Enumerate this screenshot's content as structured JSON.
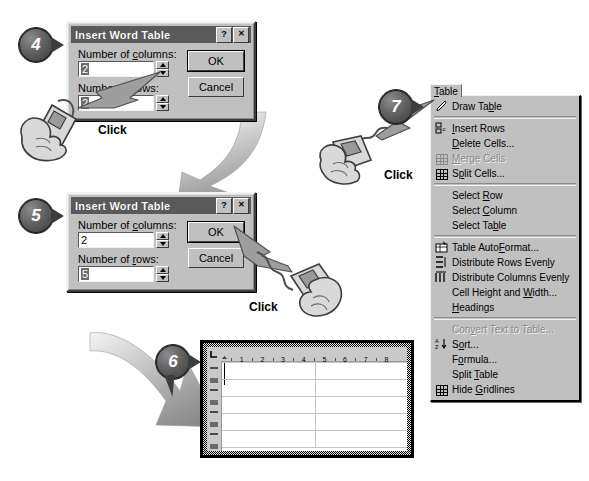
{
  "steps": [
    {
      "n": "4"
    },
    {
      "n": "5"
    },
    {
      "n": "6"
    },
    {
      "n": "7"
    }
  ],
  "dialog4": {
    "title": "Insert Word Table",
    "help_btn": "?",
    "close_btn": "✕",
    "columns_label_a": "Number of ",
    "columns_label_u": "c",
    "columns_label_b": "olumns:",
    "columns_value": "2",
    "rows_label_a": "Number of ",
    "rows_label_u": "r",
    "rows_label_b": "ows:",
    "rows_value": "2",
    "ok": "OK",
    "cancel": "Cancel"
  },
  "dialog5": {
    "title": "Insert Word Table",
    "help_btn": "?",
    "close_btn": "✕",
    "columns_label_a": "Number of ",
    "columns_label_u": "c",
    "columns_label_b": "olumns:",
    "columns_value": "2",
    "rows_label_a": "Number of ",
    "rows_label_u": "r",
    "rows_label_b": "ows:",
    "rows_value": "5",
    "ok": "OK",
    "cancel": "Cancel"
  },
  "clicks": [
    {
      "label": "Click"
    },
    {
      "label": "Click"
    },
    {
      "label": "Click"
    }
  ],
  "menu": {
    "tab_label": "Table",
    "tab_label_u": "T",
    "items": [
      {
        "type": "item",
        "icon": "pencil-icon",
        "pre": "Draw Ta",
        "u": "b",
        "post": "le",
        "disabled": false
      },
      {
        "type": "sep"
      },
      {
        "type": "item",
        "icon": "insert-rows-icon",
        "pre": "",
        "u": "I",
        "post": "nsert Rows",
        "disabled": false
      },
      {
        "type": "item",
        "icon": "none",
        "pre": "",
        "u": "D",
        "post": "elete Cells...",
        "disabled": false
      },
      {
        "type": "item",
        "icon": "merge-cells-icon",
        "pre": "",
        "u": "M",
        "post": "erge Cells",
        "disabled": true
      },
      {
        "type": "item",
        "icon": "split-cells-icon",
        "pre": "S",
        "u": "p",
        "post": "lit Cells...",
        "disabled": false
      },
      {
        "type": "sep"
      },
      {
        "type": "item",
        "icon": "none",
        "pre": "Select ",
        "u": "R",
        "post": "ow",
        "disabled": false
      },
      {
        "type": "item",
        "icon": "none",
        "pre": "Select ",
        "u": "C",
        "post": "olumn",
        "disabled": false
      },
      {
        "type": "item",
        "icon": "none",
        "pre": "Select Ta",
        "u": "b",
        "post": "le",
        "disabled": false
      },
      {
        "type": "sep"
      },
      {
        "type": "item",
        "icon": "autoformat-icon",
        "pre": "Table Auto",
        "u": "F",
        "post": "ormat...",
        "disabled": false
      },
      {
        "type": "item",
        "icon": "distribute-rows-icon",
        "pre": "Distribute Rows Even",
        "u": "l",
        "post": "y",
        "disabled": false
      },
      {
        "type": "item",
        "icon": "distribute-cols-icon",
        "pre": "Distribute Columns Even",
        "u": "l",
        "post": "y",
        "disabled": false
      },
      {
        "type": "item",
        "icon": "none",
        "pre": "Cell Height and ",
        "u": "W",
        "post": "idth...",
        "disabled": false
      },
      {
        "type": "item",
        "icon": "none",
        "pre": "",
        "u": "H",
        "post": "eadings",
        "disabled": false
      },
      {
        "type": "sep"
      },
      {
        "type": "item",
        "icon": "none",
        "pre": "Con",
        "u": "v",
        "post": "ert Text to Table...",
        "disabled": true
      },
      {
        "type": "item",
        "icon": "sort-az-icon",
        "pre": "S",
        "u": "o",
        "post": "rt...",
        "disabled": false
      },
      {
        "type": "item",
        "icon": "none",
        "pre": "F",
        "u": "o",
        "post": "rmula...",
        "disabled": false
      },
      {
        "type": "item",
        "icon": "none",
        "pre": "Split ",
        "u": "T",
        "post": "able",
        "disabled": false
      },
      {
        "type": "item",
        "icon": "hide-gridlines-icon",
        "pre": "Hide ",
        "u": "G",
        "post": "ridlines",
        "disabled": false
      }
    ]
  },
  "document": {
    "ruler_ticks": [
      "1",
      "2",
      "3",
      "4",
      "5",
      "6",
      "7",
      "8"
    ],
    "vertical_ruler_marks": 8,
    "table_rows": 5,
    "table_columns": 2
  },
  "colors": {
    "dialog_face": "#c0c0c0",
    "titlebar": "#5a5a5a",
    "badge_dark": "#3a3a3a",
    "menu_face": "#c0c0c0",
    "disabled_text": "#8a8a8a",
    "gridline": "#c4c4c4"
  }
}
